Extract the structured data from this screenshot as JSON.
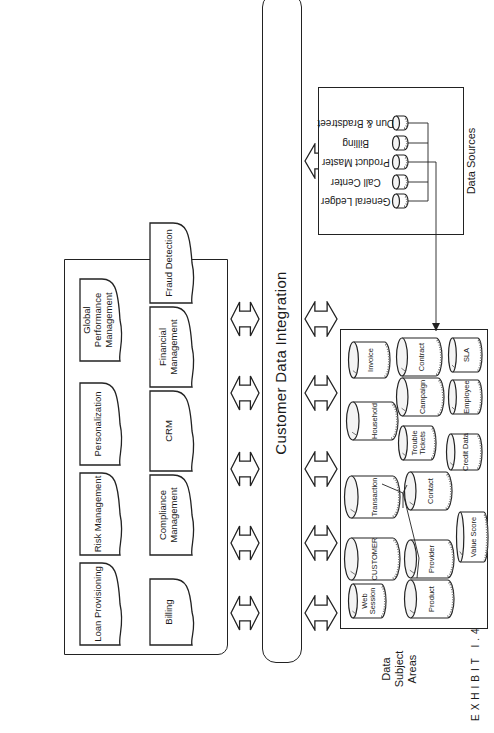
{
  "figure": {
    "caption_exhibit": "EXHIBIT I.4",
    "caption_title": "CDI Reconciles Data"
  },
  "applications": {
    "top_row": [
      {
        "label": "Loan Provisioning"
      },
      {
        "label": "Risk Management"
      },
      {
        "label": "Personalization"
      },
      {
        "label": "Global Performance Management"
      }
    ],
    "bottom_row": [
      {
        "label": "Billing"
      },
      {
        "label": "Compliance Management"
      },
      {
        "label": "CRM"
      },
      {
        "label": "Financial Management"
      },
      {
        "label": "Fraud Detection"
      }
    ]
  },
  "integration_bus": {
    "label": "Customer Data Integration",
    "top_arrow_count": 5,
    "bottom_arrow_count": 6
  },
  "subject_areas": {
    "label": "Data Subject Areas",
    "entities": [
      {
        "label": "Web Session"
      },
      {
        "label": "CUSTOMER"
      },
      {
        "label": "Transaction"
      },
      {
        "label": "Household"
      },
      {
        "label": "Invoice"
      },
      {
        "label": "Product"
      },
      {
        "label": "Provider"
      },
      {
        "label": "Contact"
      },
      {
        "label": "Trouble Tickets"
      },
      {
        "label": "Campaign"
      },
      {
        "label": "Contract"
      },
      {
        "label": "Value Score"
      },
      {
        "label": "Credit Data"
      },
      {
        "label": "Employee"
      },
      {
        "label": "SLA"
      }
    ]
  },
  "data_sources": {
    "label": "Data Sources",
    "items": [
      {
        "label": "General Ledger"
      },
      {
        "label": "Call Center"
      },
      {
        "label": "Product Master"
      },
      {
        "label": "Billing"
      },
      {
        "label": "Dun & Bradstreet"
      }
    ]
  }
}
